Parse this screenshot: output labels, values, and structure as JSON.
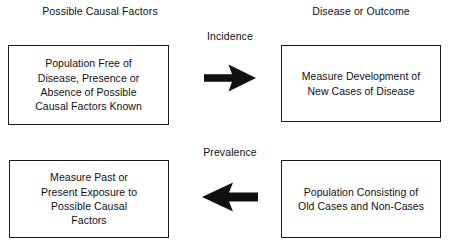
{
  "diagram": {
    "title_left": "Possible Causal Factors",
    "title_right": "Disease or Outcome",
    "headers": {
      "left": "Possible Causal\nFactors",
      "right": "Disease or Outcome"
    },
    "rows": [
      {
        "name": "incidence",
        "label": "Incidence",
        "arrow_direction": "right",
        "arrow_icon": "arrow-right-icon",
        "left_box": "Population Free of\nDisease, Presence or\nAbsence of Possible\nCausal Factors Known",
        "right_box": "Measure Development of\nNew Cases of Disease"
      },
      {
        "name": "prevalence",
        "label": "Prevalence",
        "arrow_direction": "left",
        "arrow_icon": "arrow-left-icon",
        "left_box": "Measure Past or\nPresent Exposure to\nPossible Causal\nFactors",
        "right_box": "Population Consisting of\nOld Cases and Non-Cases"
      }
    ],
    "colors": {
      "background": "#ffffff",
      "text": "#111111",
      "box_border": "#1a1a1a",
      "arrow_fill": "#111111"
    }
  }
}
